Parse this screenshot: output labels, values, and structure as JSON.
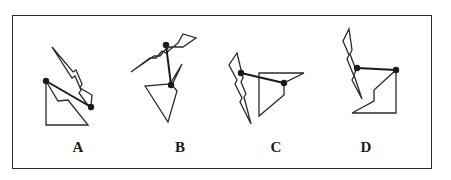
{
  "diagram": {
    "type": "spatial-reasoning-options",
    "stroke_color": "#2a2a2a",
    "dot_color": "#1a1a1a",
    "options": [
      {
        "label": "A",
        "label_x": 78,
        "bolt": "52,47 73,72 76,70 82,84 80,88 92,95 91,107 87,104 79,93 81,90 75,76 72,78",
        "shape": "46,81 46,125 88,125 68,100 58,101",
        "connector": [
          46,
          81,
          91,
          107
        ],
        "dots": [
          [
            46,
            81
          ],
          [
            91,
            107
          ]
        ]
      },
      {
        "label": "B",
        "label_x": 180,
        "bolt": "131,72 150,58 156,58 162,51 166,53 178,43 183,34 196,38 183,47 170,47 165,50 160,56 154,56",
        "shape": "145,86 168,122 177,91 172,85 182,64 170,84",
        "connector": [
          166,
          45,
          171,
          85
        ],
        "dots": [
          [
            166,
            45
          ],
          [
            171,
            85
          ]
        ]
      },
      {
        "label": "C",
        "label_x": 276,
        "bolt": "237,53 243,78 241,82 246,94 244,97 251,124 240,102 242,98 235,84 237,80 229,65",
        "shape": "259,73 304,73 284,83 284,95 259,116",
        "connector": [
          241,
          73,
          284,
          83
        ],
        "dots": [
          [
            241,
            73
          ],
          [
            284,
            83
          ]
        ]
      },
      {
        "label": "D",
        "label_x": 366,
        "bolt": "349,29 352,50 350,54 356,70 354,75 362,99 352,80 354,76 347,59 349,55 343,41",
        "shape": "396,70 396,113 352,113 374,101 374,90",
        "connector": [
          357,
          68,
          396,
          70
        ],
        "dots": [
          [
            357,
            68
          ],
          [
            396,
            70
          ]
        ]
      }
    ]
  }
}
